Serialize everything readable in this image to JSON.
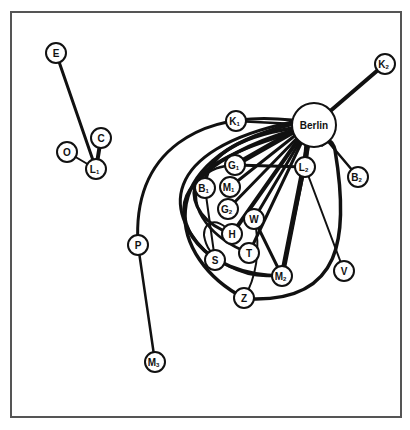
{
  "diagram": {
    "type": "network",
    "hub": "Berlin",
    "colors": {
      "stroke": "#111111",
      "fill": "#ffffff",
      "frame": "#555555"
    },
    "nodes": [
      {
        "id": "E",
        "label": "E",
        "sub": "",
        "x": 56,
        "y": 53,
        "r": 10
      },
      {
        "id": "C",
        "label": "C",
        "sub": "",
        "x": 101,
        "y": 138,
        "r": 10
      },
      {
        "id": "O",
        "label": "O",
        "sub": "",
        "x": 67,
        "y": 152,
        "r": 10
      },
      {
        "id": "L1",
        "label": "L",
        "sub": "1",
        "x": 96,
        "y": 169,
        "r": 10
      },
      {
        "id": "K1",
        "label": "K",
        "sub": "1",
        "x": 236,
        "y": 121,
        "r": 10
      },
      {
        "id": "Berlin",
        "label": "Berlin",
        "sub": "",
        "x": 314,
        "y": 125,
        "r": 22
      },
      {
        "id": "K2",
        "label": "K",
        "sub": "2",
        "x": 385,
        "y": 64,
        "r": 10
      },
      {
        "id": "B2",
        "label": "B",
        "sub": "2",
        "x": 358,
        "y": 177,
        "r": 10
      },
      {
        "id": "G1",
        "label": "G",
        "sub": "1",
        "x": 235,
        "y": 165,
        "r": 10
      },
      {
        "id": "L2",
        "label": "L",
        "sub": "2",
        "x": 305,
        "y": 167,
        "r": 10
      },
      {
        "id": "B1",
        "label": "B",
        "sub": "1",
        "x": 205,
        "y": 188,
        "r": 10
      },
      {
        "id": "M1",
        "label": "M",
        "sub": "1",
        "x": 230,
        "y": 187,
        "r": 10
      },
      {
        "id": "G2",
        "label": "G",
        "sub": "2",
        "x": 228,
        "y": 209,
        "r": 10
      },
      {
        "id": "W",
        "label": "W",
        "sub": "",
        "x": 254,
        "y": 219,
        "r": 10
      },
      {
        "id": "H",
        "label": "H",
        "sub": "",
        "x": 232,
        "y": 234,
        "r": 10
      },
      {
        "id": "T",
        "label": "T",
        "sub": "",
        "x": 249,
        "y": 253,
        "r": 10
      },
      {
        "id": "S",
        "label": "S",
        "sub": "",
        "x": 215,
        "y": 260,
        "r": 10
      },
      {
        "id": "M2",
        "label": "M",
        "sub": "2",
        "x": 282,
        "y": 276,
        "r": 10
      },
      {
        "id": "V",
        "label": "V",
        "sub": "",
        "x": 344,
        "y": 271,
        "r": 10
      },
      {
        "id": "Z",
        "label": "Z",
        "sub": "",
        "x": 244,
        "y": 298,
        "r": 10
      },
      {
        "id": "P",
        "label": "P",
        "sub": "",
        "x": 138,
        "y": 245,
        "r": 10
      },
      {
        "id": "M3",
        "label": "M",
        "sub": "3",
        "x": 155,
        "y": 362,
        "r": 10
      }
    ],
    "edges": [
      {
        "from": "E",
        "to": "L1",
        "w": 3,
        "d": "M56,53 L96,169"
      },
      {
        "from": "C",
        "to": "L1",
        "w": 4,
        "d": "M101,138 L96,169"
      },
      {
        "from": "O",
        "to": "L1",
        "w": 2,
        "d": "M67,152 L96,169"
      },
      {
        "from": "K1",
        "to": "Berlin",
        "w": 2.5,
        "d": "M236,121 L314,125"
      },
      {
        "from": "K2",
        "to": "Berlin",
        "w": 4,
        "d": "M385,64 L314,125"
      },
      {
        "from": "B2",
        "to": "Berlin",
        "w": 2.5,
        "d": "M358,177 L314,125"
      },
      {
        "from": "L2",
        "to": "Berlin",
        "w": 5,
        "d": "M305,167 L308,130"
      },
      {
        "from": "G1",
        "to": "Berlin",
        "w": 5,
        "d": "M235,165 L300,128"
      },
      {
        "from": "G1",
        "to": "L2",
        "w": 3,
        "d": "M235,165 L305,167"
      },
      {
        "from": "M1",
        "to": "Berlin",
        "w": 3,
        "d": "M230,187 L302,130"
      },
      {
        "from": "G2",
        "to": "Berlin",
        "w": 3,
        "d": "M228,209 L303,132"
      },
      {
        "from": "W",
        "to": "Berlin",
        "w": 3,
        "d": "M254,219 L305,133"
      },
      {
        "from": "H",
        "to": "Berlin",
        "w": 4,
        "d": "M232,234 L303,133"
      },
      {
        "from": "T",
        "to": "Berlin",
        "w": 3,
        "d": "M249,253 L306,133"
      },
      {
        "from": "M2",
        "to": "Berlin",
        "w": 5,
        "d": "M282,276 L310,134"
      },
      {
        "from": "M2",
        "to": "L2",
        "w": 2.5,
        "d": "M282,276 L305,167"
      },
      {
        "from": "V",
        "to": "L2",
        "w": 2,
        "d": "M344,271 L305,167"
      },
      {
        "from": "W",
        "to": "M2",
        "w": 3,
        "d": "M254,219 L282,276"
      },
      {
        "from": "W",
        "to": "Z",
        "w": 2,
        "d": "M254,219 C262,250 255,280 244,298"
      },
      {
        "from": "P",
        "to": "M3",
        "w": 2.5,
        "d": "M138,245 L155,362"
      },
      {
        "from": "P",
        "to": "Berlin",
        "w": 3,
        "d": "M138,245 C132,150 200,110 292,120"
      },
      {
        "from": "B1",
        "to": "Berlin",
        "w": 3.5,
        "d": "M205,188 C205,150 250,135 293,128"
      },
      {
        "from": "B1",
        "to": "S",
        "w": 2,
        "d": "M205,188 L215,260"
      },
      {
        "from": "S",
        "to": "Berlin",
        "w": 3,
        "d": "M215,260 C160,215 160,150 292,122"
      },
      {
        "from": "Z",
        "to": "Berlin",
        "w": 3.5,
        "d": "M244,298 C170,260 145,160 293,124"
      },
      {
        "from": "M2",
        "to": "Berlin",
        "w": 3.5,
        "d": "M282,276 C200,275 170,220 190,190 C210,160 260,140 294,130"
      },
      {
        "from": "H",
        "to": "B1",
        "w": 3,
        "d": "M232,234 C205,225 190,205 195,185 C200,170 230,150 296,132"
      },
      {
        "from": "T",
        "to": "G1",
        "w": 2.5,
        "d": "M249,253 C215,240 185,210 200,180 C210,168 222,166 235,165"
      },
      {
        "from": "Z",
        "to": "Berlin_right",
        "w": 3.5,
        "d": "M254,299 C340,300 350,240 335,150 C332,138 328,140 322,145"
      },
      {
        "from": "M2",
        "to": "H_loop",
        "w": 2,
        "d": "M272,276 C240,278 210,260 205,240 C200,225 215,212 232,234"
      }
    ]
  }
}
